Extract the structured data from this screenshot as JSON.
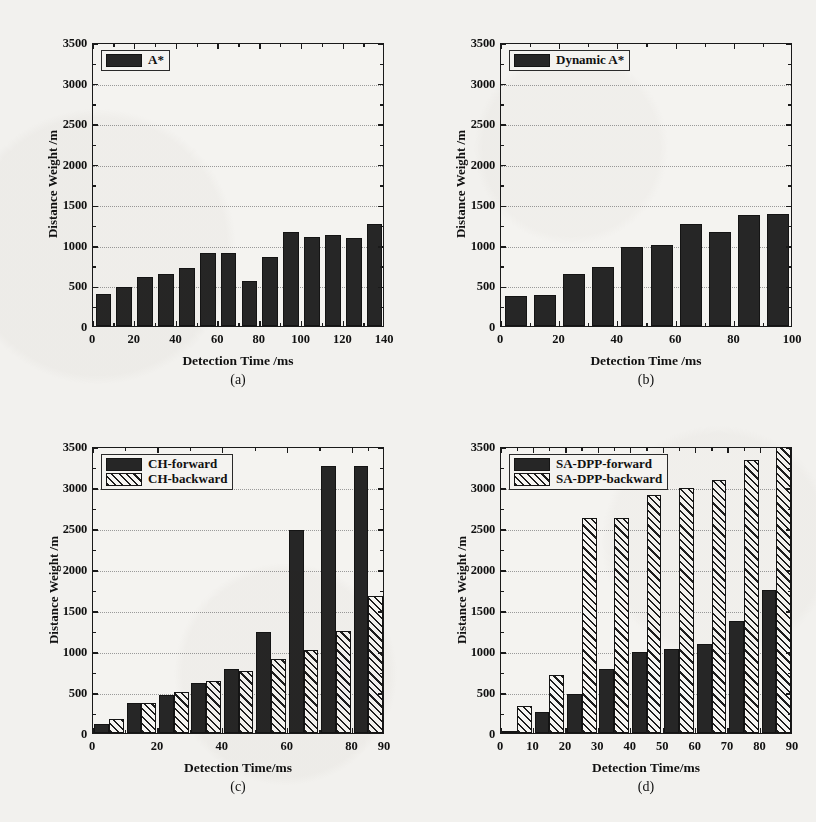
{
  "figure": {
    "background_color": "#f2f1ee",
    "bar_solid_color": "#262626",
    "bar_hatch_color": "#1d1d1d"
  },
  "chart_data": [
    {
      "panel": "a",
      "caption": "(a)",
      "type": "bar",
      "title": "",
      "xlabel": "Detection Time /ms",
      "ylabel": "Distance Weight /m",
      "xlim": [
        0,
        140
      ],
      "ylim": [
        0,
        3500
      ],
      "xticks": [
        0,
        20,
        40,
        60,
        80,
        100,
        120,
        140
      ],
      "yticks": [
        0,
        500,
        1000,
        1500,
        2000,
        2500,
        3000,
        3500
      ],
      "grid": true,
      "legend": [
        "A*"
      ],
      "legend_position": "top-left",
      "series": [
        {
          "name": "A*",
          "style": "solid",
          "x": [
            5,
            15,
            25,
            35,
            45,
            55,
            65,
            75,
            85,
            95,
            105,
            115,
            125,
            135
          ],
          "values": [
            400,
            475,
            610,
            635,
            710,
            905,
            905,
            555,
            845,
            1155,
            1100,
            1125,
            1080,
            1255
          ]
        }
      ]
    },
    {
      "panel": "b",
      "caption": "(b)",
      "type": "bar",
      "title": "",
      "xlabel": "Detection Time /ms",
      "ylabel": "Distance Weight /m",
      "xlim": [
        0,
        100
      ],
      "ylim": [
        0,
        3500
      ],
      "xticks": [
        0,
        20,
        40,
        60,
        80,
        100
      ],
      "yticks": [
        0,
        500,
        1000,
        1500,
        2000,
        2500,
        3000,
        3500
      ],
      "grid": true,
      "legend": [
        "Dynamic A*"
      ],
      "legend_position": "top-left",
      "series": [
        {
          "name": "Dynamic A*",
          "style": "solid",
          "x": [
            5,
            15,
            25,
            35,
            45,
            55,
            65,
            75,
            85,
            95
          ],
          "values": [
            375,
            385,
            645,
            730,
            975,
            995,
            1255,
            1160,
            1370,
            1380
          ]
        }
      ]
    },
    {
      "panel": "c",
      "caption": "(c)",
      "type": "bar",
      "title": "",
      "xlabel": "Detection Time/ms",
      "ylabel": "Distance Weight /m",
      "xlim": [
        0,
        90
      ],
      "ylim": [
        0,
        3500
      ],
      "xticks": [
        0,
        20,
        40,
        60,
        80,
        90
      ],
      "yticks": [
        0,
        500,
        1000,
        1500,
        2000,
        2500,
        3000,
        3500
      ],
      "grid": true,
      "legend": [
        "CH-forward",
        "CH-backward"
      ],
      "legend_position": "top-left",
      "categories": [
        5,
        15,
        25,
        35,
        45,
        55,
        65,
        75,
        85
      ],
      "series": [
        {
          "name": "CH-forward",
          "style": "solid",
          "values": [
            105,
            370,
            465,
            605,
            775,
            1230,
            2480,
            3260,
            3255
          ]
        },
        {
          "name": "CH-backward",
          "style": "hatch",
          "values": [
            170,
            370,
            500,
            640,
            760,
            905,
            1010,
            1240,
            1665
          ]
        }
      ]
    },
    {
      "panel": "d",
      "caption": "(d)",
      "type": "bar",
      "title": "",
      "xlabel": "Detection Time/ms",
      "ylabel": "Distance Weight /m",
      "xlim": [
        0,
        90
      ],
      "ylim": [
        0,
        3500
      ],
      "xticks": [
        0,
        10,
        20,
        30,
        40,
        50,
        60,
        70,
        80,
        90
      ],
      "yticks": [
        0,
        500,
        1000,
        1500,
        2000,
        2500,
        3000,
        3500
      ],
      "grid": true,
      "legend": [
        "SA-DPP-forward",
        "SA-DPP-backward"
      ],
      "legend_position": "top-left",
      "categories": [
        5,
        15,
        25,
        35,
        45,
        55,
        65,
        75,
        85
      ],
      "series": [
        {
          "name": "SA-DPP-forward",
          "style": "solid",
          "values": [
            20,
            255,
            480,
            775,
            985,
            1030,
            1085,
            1360,
            1745
          ]
        },
        {
          "name": "SA-DPP-backward",
          "style": "hatch",
          "values": [
            330,
            705,
            2620,
            2620,
            2905,
            2985,
            3080,
            3330,
            3500
          ]
        }
      ]
    }
  ]
}
